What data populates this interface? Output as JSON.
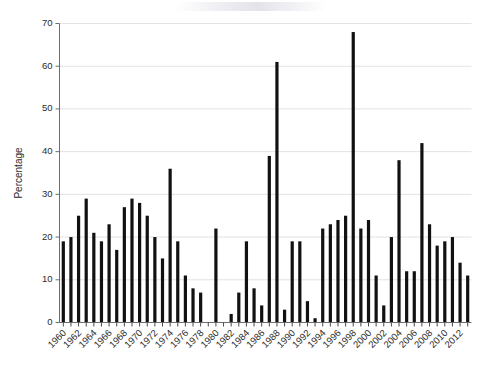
{
  "chart_data": {
    "type": "bar",
    "title": "",
    "subtitle": "",
    "xlabel": "",
    "ylabel": "Percentage",
    "ylim": [
      0,
      70
    ],
    "ytick_step": 10,
    "ytick_labels": [
      "0",
      "10",
      "20",
      "30",
      "40",
      "50",
      "60",
      "70"
    ],
    "grid": true,
    "grid_axis": "y",
    "legend": "none",
    "bar_color": "#111111",
    "xtick_label_rotation": -45,
    "xtick_label_step": 2,
    "categories": [
      "1960",
      "1961",
      "1962",
      "1963",
      "1964",
      "1965",
      "1966",
      "1967",
      "1968",
      "1969",
      "1970",
      "1971",
      "1972",
      "1973",
      "1974",
      "1975",
      "1976",
      "1977",
      "1978",
      "1979",
      "1980",
      "1981",
      "1982",
      "1983",
      "1984",
      "1985",
      "1986",
      "1987",
      "1988",
      "1989",
      "1990",
      "1991",
      "1992",
      "1993",
      "1994",
      "1995",
      "1996",
      "1997",
      "1998",
      "1999",
      "2000",
      "2001",
      "2002",
      "2003",
      "2004",
      "2005",
      "2006",
      "2007",
      "2008",
      "2009",
      "2010",
      "2011",
      "2012",
      "2013"
    ],
    "values": [
      19,
      20,
      25,
      29,
      21,
      19,
      23,
      17,
      27,
      29,
      28,
      25,
      20,
      15,
      36,
      19,
      11,
      8,
      7,
      0,
      22,
      0,
      2,
      7,
      19,
      8,
      4,
      39,
      61,
      3,
      19,
      19,
      5,
      1,
      22,
      23,
      24,
      25,
      68,
      22,
      24,
      11,
      4,
      20,
      38,
      12,
      12,
      42,
      23,
      18,
      19,
      20,
      14,
      11
    ],
    "xtick_labels_shown": [
      "1960",
      "1962",
      "1964",
      "1966",
      "1968",
      "1970",
      "1972",
      "1974",
      "1976",
      "1978",
      "1980",
      "1982",
      "1984",
      "1986",
      "1988",
      "1990",
      "1992",
      "1994",
      "1996",
      "1998",
      "2000",
      "2002",
      "2004",
      "2006",
      "2008",
      "2010",
      "2012"
    ]
  },
  "axes": {
    "y_axis_title": "Percentage"
  }
}
